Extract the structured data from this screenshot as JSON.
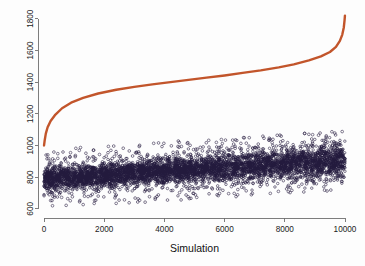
{
  "chart_data": {
    "type": "scatter",
    "title": "",
    "xlabel": "Simulation",
    "ylabel": "",
    "xlim": [
      0,
      10000
    ],
    "ylim": [
      580,
      1830
    ],
    "grid": false,
    "legend": null,
    "xticks": [
      0,
      2000,
      4000,
      6000,
      8000,
      10000
    ],
    "xtick_labels": [
      "0",
      "2000",
      "4000",
      "6000",
      "8000",
      "10000"
    ],
    "yticks": [
      600,
      800,
      1000,
      1200,
      1400,
      1600,
      1800
    ],
    "ytick_labels": [
      "600",
      "800",
      "1000",
      "1200",
      "1400",
      "1600",
      "1800"
    ],
    "series": [
      {
        "name": "sorted-curve",
        "type": "line",
        "color": "#c2552b",
        "marker": "point",
        "description": "Monotonically increasing sorted values, S-shaped ogive",
        "x": [
          1,
          25,
          60,
          120,
          220,
          380,
          600,
          900,
          1300,
          1800,
          2400,
          3000,
          3600,
          4200,
          4800,
          5400,
          6000,
          6600,
          7200,
          7800,
          8300,
          8800,
          9200,
          9500,
          9700,
          9830,
          9910,
          9960,
          9985,
          9998
        ],
        "y": [
          1000,
          1035,
          1075,
          1115,
          1155,
          1195,
          1235,
          1270,
          1300,
          1328,
          1352,
          1370,
          1386,
          1400,
          1414,
          1428,
          1442,
          1458,
          1474,
          1493,
          1512,
          1537,
          1562,
          1590,
          1622,
          1660,
          1700,
          1745,
          1790,
          1820
        ]
      },
      {
        "name": "simulation-cloud",
        "type": "scatter",
        "color": "#241a3d",
        "marker": "open-circle",
        "n_points": 10000,
        "description": "Dense band of simulated values rising gently from about 790 to about 900 with spread of roughly plus or minus 110",
        "trend_y_start": 790,
        "trend_y_end": 905,
        "spread": 110,
        "y_min_observed": 600,
        "y_max_observed": 1120
      }
    ]
  },
  "axes": {
    "x_title": "Simulation"
  }
}
